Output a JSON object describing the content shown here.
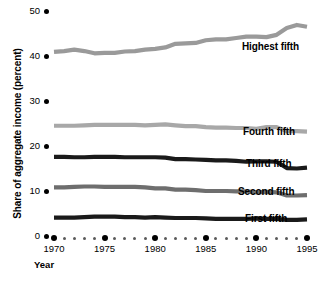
{
  "chart_data": {
    "type": "line",
    "title": "",
    "xlabel": "Year",
    "ylabel": "Share of aggregate income (percent)",
    "xlim": [
      1970,
      1995
    ],
    "ylim": [
      0,
      50
    ],
    "grid": false,
    "legend_position": "inline-right",
    "y_ticks": [
      50,
      40,
      30,
      20,
      10,
      0
    ],
    "y_tick_labels": [
      "50",
      "40",
      "30",
      "20",
      "10",
      "0"
    ],
    "x_ticks": [
      1970,
      1975,
      1980,
      1985,
      1990,
      1995
    ],
    "x_tick_labels": [
      "1970",
      "1975",
      "1980",
      "1985",
      "1990",
      "1995"
    ],
    "x": [
      1970,
      1971,
      1972,
      1973,
      1974,
      1975,
      1976,
      1977,
      1978,
      1979,
      1980,
      1981,
      1982,
      1983,
      1984,
      1985,
      1986,
      1987,
      1988,
      1989,
      1990,
      1991,
      1992,
      1993,
      1994,
      1995
    ],
    "series": [
      {
        "name": "Highest fifth",
        "color": "#9a9a9a",
        "label_x": 242,
        "label_y": 41,
        "values": [
          40.9,
          41.1,
          41.4,
          41.1,
          40.6,
          40.7,
          40.7,
          41.0,
          41.1,
          41.4,
          41.6,
          41.9,
          42.7,
          42.8,
          42.9,
          43.5,
          43.7,
          43.7,
          44.0,
          44.3,
          44.3,
          44.2,
          44.7,
          46.2,
          46.9,
          46.5
        ]
      },
      {
        "name": "Fourth fifth",
        "color": "#a8a8a8",
        "label_x": 243,
        "label_y": 126,
        "values": [
          24.5,
          24.5,
          24.5,
          24.6,
          24.7,
          24.7,
          24.7,
          24.7,
          24.7,
          24.6,
          24.7,
          24.8,
          24.6,
          24.4,
          24.4,
          24.2,
          24.1,
          24.1,
          24.0,
          24.0,
          23.8,
          24.2,
          24.2,
          23.3,
          23.3,
          23.2
        ]
      },
      {
        "name": "Third fifth",
        "color": "#1a1a1a",
        "label_x": 246,
        "label_y": 158,
        "values": [
          17.6,
          17.6,
          17.5,
          17.5,
          17.6,
          17.6,
          17.6,
          17.5,
          17.5,
          17.5,
          17.5,
          17.4,
          17.1,
          17.1,
          17.0,
          16.9,
          16.8,
          16.8,
          16.7,
          16.5,
          16.6,
          16.6,
          16.5,
          15.1,
          15.0,
          15.2
        ]
      },
      {
        "name": "Second fifth",
        "color": "#6e6e6e",
        "label_x": 238,
        "label_y": 186,
        "values": [
          10.8,
          10.8,
          10.9,
          11.0,
          11.0,
          10.9,
          10.9,
          10.9,
          10.9,
          10.8,
          10.6,
          10.6,
          10.3,
          10.3,
          10.2,
          10.0,
          10.0,
          10.0,
          9.9,
          9.9,
          9.7,
          9.8,
          9.7,
          9.0,
          9.0,
          9.1
        ]
      },
      {
        "name": "First fifth",
        "color": "#1a1a1a",
        "label_x": 245,
        "label_y": 213,
        "values": [
          4.1,
          4.1,
          4.1,
          4.2,
          4.3,
          4.3,
          4.3,
          4.2,
          4.2,
          4.1,
          4.2,
          4.1,
          4.0,
          4.0,
          4.0,
          3.9,
          3.8,
          3.8,
          3.8,
          3.8,
          3.9,
          3.8,
          3.8,
          3.6,
          3.6,
          3.7
        ]
      }
    ]
  },
  "axes": {
    "y_title": "Share of aggregate income (percent)",
    "x_title": "Year"
  }
}
